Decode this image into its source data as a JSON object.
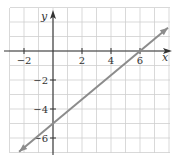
{
  "chart_data": {
    "type": "line",
    "title": "",
    "xlabel": "x",
    "ylabel": "y",
    "xlim": [
      -3,
      8
    ],
    "ylim": [
      -7,
      3
    ],
    "grid": true,
    "x_ticks": [
      -2,
      2,
      4,
      6
    ],
    "y_ticks": [
      -2,
      -4,
      -6
    ],
    "x_tick_labels": [
      "−2",
      "2",
      "4",
      "6"
    ],
    "y_tick_labels": [
      "−2",
      "−4",
      "−6"
    ],
    "series": [
      {
        "name": "line",
        "equation": "y = (5/6)x - 5",
        "slope": 0.8333,
        "y_intercept": -5,
        "x_intercept": 6,
        "x": [
          -2.34,
          0,
          6,
          7.93
        ],
        "y": [
          -6.95,
          -5,
          0,
          1.61
        ],
        "arrows": "both"
      }
    ],
    "legend": "none"
  },
  "colors": {
    "grid": "#cfcfcf",
    "axis": "#333333",
    "line": "#8c8c8c",
    "background": "#ffffff"
  }
}
